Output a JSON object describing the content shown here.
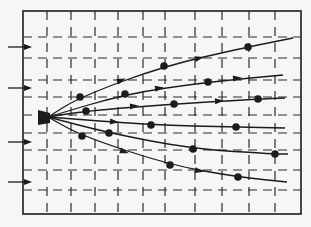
{
  "diagram": {
    "colors": {
      "background": "#f6f6f4",
      "ink": "#1c1c1c",
      "grid": "#2a2a2a"
    },
    "source": {
      "label": "",
      "shape": "wedge"
    },
    "incoming_arrows": 4,
    "trajectories": [
      {
        "name": "trajectory-1",
        "markers": 3,
        "arrows": 2
      },
      {
        "name": "trajectory-2",
        "markers": 2,
        "arrows": 2
      },
      {
        "name": "trajectory-3",
        "markers": 3,
        "arrows": 2
      },
      {
        "name": "trajectory-4",
        "markers": 2,
        "arrows": 1
      },
      {
        "name": "trajectory-5",
        "markers": 3,
        "arrows": 0
      },
      {
        "name": "trajectory-6",
        "markers": 3,
        "arrows": 2
      }
    ]
  }
}
